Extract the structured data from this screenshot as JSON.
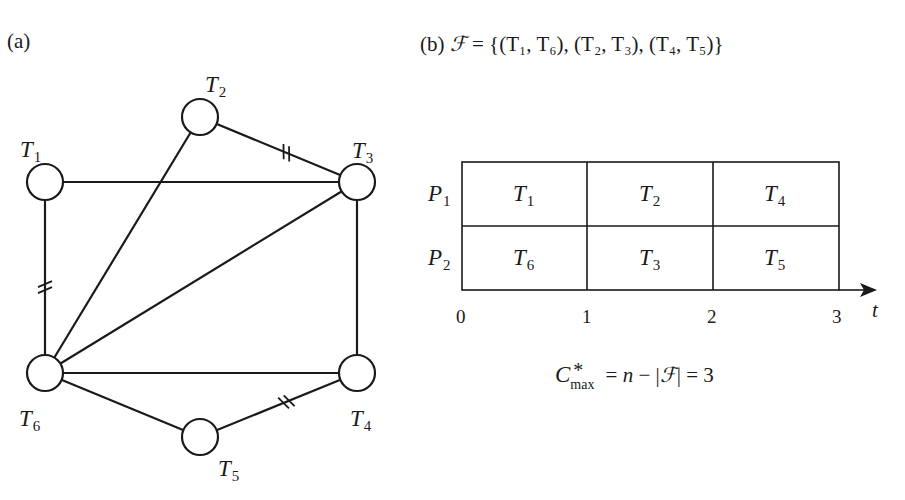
{
  "panel_a": {
    "label": "(a)",
    "nodes": [
      {
        "id": "T1",
        "name": "T",
        "sub": "1",
        "x": 45,
        "y": 182
      },
      {
        "id": "T2",
        "name": "T",
        "sub": "2",
        "x": 200,
        "y": 117
      },
      {
        "id": "T3",
        "name": "T",
        "sub": "3",
        "x": 357,
        "y": 182
      },
      {
        "id": "T4",
        "name": "T",
        "sub": "4",
        "x": 357,
        "y": 373
      },
      {
        "id": "T5",
        "name": "T",
        "sub": "5",
        "x": 200,
        "y": 437
      },
      {
        "id": "T6",
        "name": "T",
        "sub": "6",
        "x": 45,
        "y": 373
      }
    ],
    "edges": [
      {
        "from": "T1",
        "to": "T3",
        "marked": false
      },
      {
        "from": "T1",
        "to": "T6",
        "marked": true
      },
      {
        "from": "T2",
        "to": "T3",
        "marked": true
      },
      {
        "from": "T2",
        "to": "T6",
        "marked": false
      },
      {
        "from": "T3",
        "to": "T6",
        "marked": false
      },
      {
        "from": "T3",
        "to": "T4",
        "marked": false
      },
      {
        "from": "T6",
        "to": "T4",
        "marked": false
      },
      {
        "from": "T6",
        "to": "T5",
        "marked": false
      },
      {
        "from": "T5",
        "to": "T4",
        "marked": true
      }
    ]
  },
  "panel_b": {
    "label": "(b)",
    "set_symbol": "ℱ",
    "set_text": " = {(T₁, T₆), (T₂, T₃), (T₄, T₅)}",
    "pairs": [
      [
        "T1",
        "T6"
      ],
      [
        "T2",
        "T3"
      ],
      [
        "T4",
        "T5"
      ]
    ],
    "processors": [
      {
        "name": "P",
        "sub": "1",
        "tasks": [
          {
            "name": "T",
            "sub": "1"
          },
          {
            "name": "T",
            "sub": "2"
          },
          {
            "name": "T",
            "sub": "4"
          }
        ]
      },
      {
        "name": "P",
        "sub": "2",
        "tasks": [
          {
            "name": "T",
            "sub": "6"
          },
          {
            "name": "T",
            "sub": "3"
          },
          {
            "name": "T",
            "sub": "5"
          }
        ]
      }
    ],
    "time_ticks": [
      "0",
      "1",
      "2",
      "3"
    ],
    "time_axis_label": "t",
    "result": {
      "c": "C",
      "star": "*",
      "sub": "max",
      "rhs_pre": " = ",
      "n": "n",
      "rhs_mid": " − |",
      "f": "ℱ",
      "rhs_post": "| = 3"
    }
  }
}
